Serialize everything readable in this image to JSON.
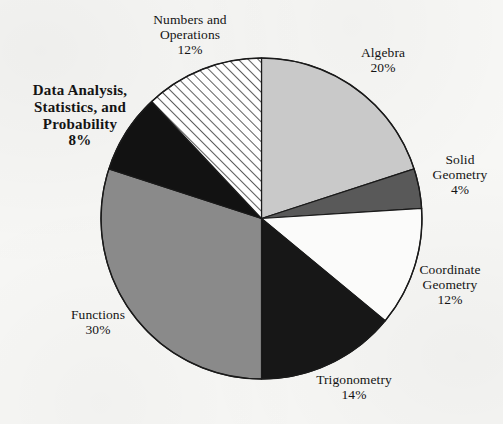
{
  "figure": {
    "background_color": "#f7f7f5",
    "outline_color": "#1a1a1a"
  },
  "chart_data": {
    "type": "pie",
    "title": "",
    "subtitle": "",
    "xlabel": "",
    "ylabel": "",
    "legend_position": "none",
    "grid": false,
    "units": "percent",
    "total": 100,
    "start_angle_deg": 0,
    "direction": "clockwise",
    "categories": [
      "Algebra",
      "Solid Geometry",
      "Coordinate Geometry",
      "Trigonometry",
      "Functions",
      "Data Analysis, Statistics, and Probability",
      "Numbers and Operations"
    ],
    "values": [
      20,
      4,
      12,
      14,
      30,
      8,
      12
    ],
    "slices": [
      {
        "id": "algebra",
        "name": "Algebra",
        "name_lines": [
          "Algebra"
        ],
        "value": 20,
        "value_label": "20%",
        "fill": "#c9c9c9",
        "pattern": "solid",
        "start_deg": 0,
        "end_deg": 72,
        "emphasis": false
      },
      {
        "id": "solid-geometry",
        "name": "Solid Geometry",
        "name_lines": [
          "Solid",
          "Geometry"
        ],
        "value": 4,
        "value_label": "4%",
        "fill": "#595959",
        "pattern": "solid",
        "start_deg": 72,
        "end_deg": 86.4,
        "emphasis": false
      },
      {
        "id": "coordinate-geometry",
        "name": "Coordinate Geometry",
        "name_lines": [
          "Coordinate",
          "Geometry"
        ],
        "value": 12,
        "value_label": "12%",
        "fill": "#fbfbfa",
        "pattern": "solid",
        "start_deg": 86.4,
        "end_deg": 129.6,
        "emphasis": false
      },
      {
        "id": "trigonometry",
        "name": "Trigonometry",
        "name_lines": [
          "Trigonometry"
        ],
        "value": 14,
        "value_label": "14%",
        "fill": "#171717",
        "pattern": "solid",
        "start_deg": 129.6,
        "end_deg": 180,
        "emphasis": false
      },
      {
        "id": "functions",
        "name": "Functions",
        "name_lines": [
          "Functions"
        ],
        "value": 30,
        "value_label": "30%",
        "fill": "#8a8a8a",
        "pattern": "solid",
        "start_deg": 180,
        "end_deg": 288,
        "emphasis": false
      },
      {
        "id": "data-analysis",
        "name": "Data Analysis, Statistics, and Probability",
        "name_lines": [
          "Data Analysis,",
          "Statistics, and",
          "Probability"
        ],
        "value": 8,
        "value_label": "8%",
        "fill": "#121212",
        "pattern": "solid",
        "start_deg": 288,
        "end_deg": 316.8,
        "emphasis": true
      },
      {
        "id": "numbers-and-operations",
        "name": "Numbers and Operations",
        "name_lines": [
          "Numbers and",
          "Operations"
        ],
        "value": 12,
        "value_label": "12%",
        "fill": "#ffffff",
        "pattern": "diagonal-hatch",
        "start_deg": 316.8,
        "end_deg": 360,
        "emphasis": false
      }
    ]
  }
}
